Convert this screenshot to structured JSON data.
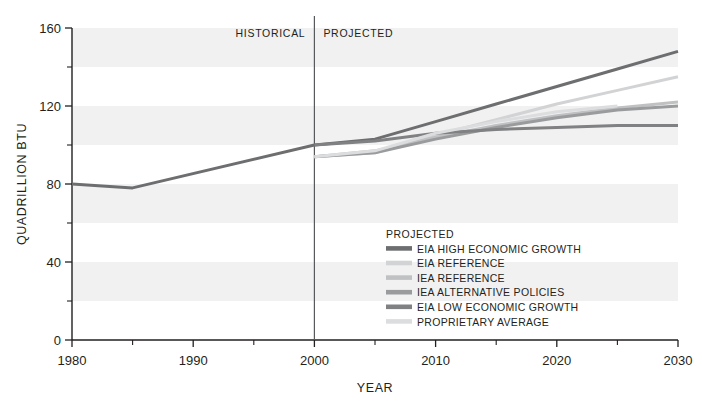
{
  "chart_data": {
    "type": "line",
    "title": "",
    "xlabel": "YEAR",
    "ylabel": "QUADRILLION BTU",
    "xlim": [
      1980,
      2030
    ],
    "ylim": [
      0,
      160
    ],
    "xticks": [
      1980,
      1990,
      2000,
      2010,
      2020,
      2030
    ],
    "xticklabels": [
      "1980",
      "1990",
      "2000",
      "2010",
      "2020",
      "2030"
    ],
    "xminorticks": [
      1985,
      1995,
      2005,
      2015,
      2025
    ],
    "yticks": [
      0,
      40,
      80,
      120,
      160
    ],
    "yticklabels": [
      "0",
      "40",
      "80",
      "120",
      "160"
    ],
    "yminorticks": [
      20,
      60,
      100,
      140
    ],
    "grid": false,
    "background_bands": true,
    "band_interval": 20,
    "legend_position": "inside-lower-right",
    "annotations": [
      {
        "text": "HISTORICAL",
        "x": 2000,
        "align": "right"
      },
      {
        "text": "PROJECTED",
        "x": 2000,
        "align": "left"
      }
    ],
    "divider_x": 2000,
    "series": [
      {
        "name": "HISTORICAL",
        "color": "#6d6e70",
        "width": 3.0,
        "in_legend": false,
        "x": [
          1980,
          1985,
          2000
        ],
        "values": [
          80,
          78,
          100
        ]
      },
      {
        "name": "EIA HIGH ECONOMIC GROWTH",
        "color": "#6d6e70",
        "width": 3.0,
        "in_legend": true,
        "x": [
          2000,
          2005,
          2010,
          2015,
          2020,
          2025,
          2030
        ],
        "values": [
          100,
          103,
          112,
          121,
          130,
          139,
          148
        ]
      },
      {
        "name": "EIA REFERENCE",
        "color": "#d2d3d5",
        "width": 3.0,
        "in_legend": true,
        "x": [
          2000,
          2005,
          2010,
          2015,
          2020,
          2025,
          2030
        ],
        "values": [
          94,
          96,
          105,
          113,
          121,
          128,
          135
        ]
      },
      {
        "name": "IEA REFERENCE",
        "color": "#c0c1c3",
        "width": 3.0,
        "in_legend": true,
        "x": [
          2000,
          2005,
          2010,
          2015,
          2020,
          2025,
          2030
        ],
        "values": [
          94,
          97,
          104,
          110,
          115,
          119,
          122
        ]
      },
      {
        "name": "IEA ALTERNATIVE POLICIES",
        "color": "#9a9b9d",
        "width": 3.0,
        "in_legend": true,
        "x": [
          2000,
          2005,
          2010,
          2015,
          2020,
          2025,
          2030
        ],
        "values": [
          94,
          96,
          103,
          109,
          114,
          118,
          120
        ]
      },
      {
        "name": "EIA LOW ECONOMIC GROWTH",
        "color": "#808183",
        "width": 3.0,
        "in_legend": true,
        "x": [
          2000,
          2005,
          2010,
          2015,
          2020,
          2025,
          2030
        ],
        "values": [
          100,
          102,
          106,
          108,
          109,
          110,
          110
        ]
      },
      {
        "name": "PROPRIETARY AVERAGE",
        "color": "#dcdddf",
        "width": 3.0,
        "in_legend": true,
        "x": [
          2000,
          2005,
          2010,
          2015,
          2020,
          2025
        ],
        "values": [
          94,
          97,
          106,
          112,
          117,
          120
        ]
      }
    ]
  },
  "legend": {
    "title": "PROJECTED"
  },
  "axes": {
    "x_title": "YEAR",
    "y_title": "QUADRILLION BTU"
  },
  "period_labels": {
    "historical": "HISTORICAL",
    "projected": "PROJECTED"
  }
}
